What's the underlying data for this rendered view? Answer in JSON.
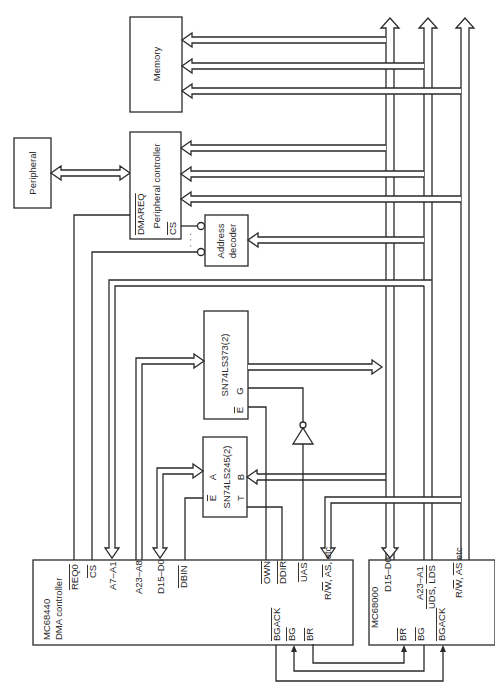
{
  "diagram": {
    "type": "block-diagram",
    "orientation": "rotated-90-ccw",
    "blocks": {
      "memory": "Memory",
      "peripheral": "Peripheral",
      "peripheral_controller": "Peripheral controller",
      "address_decoder_1": "Address",
      "address_decoder_2": "decoder",
      "latch": "SN74LS373(2)",
      "transceiver": "SN74LS245(2)",
      "dma_name": "MC68440",
      "dma_desc": "DMA controller",
      "cpu_name": "MC68000"
    },
    "pins": {
      "pc_dmareq": "DMAREQ",
      "pc_cs": "CS",
      "latch_g": "G",
      "latch_e": "E",
      "xcvr_a": "A",
      "xcvr_b": "B",
      "xcvr_e": "E",
      "xcvr_t": "T",
      "dma_reqo": "REQ0",
      "dma_cs": "CS",
      "dma_a7a1": "A7–A1",
      "dma_a23a8": "A23–A8",
      "dma_d15d0": "D15–D0",
      "dma_dbin": "DBIN",
      "dma_own": "OWN",
      "dma_ddir": "DDIR",
      "dma_uas": "UAS",
      "dma_rw_pre": "R/",
      "dma_rw_w": "W",
      "dma_rw_sep": ", ",
      "dma_rw_as": "AS",
      "dma_rw_etc": ", etc",
      "dma_bgack": "BGACK",
      "dma_bg": "BG",
      "dma_br": "BR",
      "cpu_d15d0": "D15–D0",
      "cpu_a23a1": "A23–A1",
      "cpu_uds": "UDS",
      "cpu_lds": "LDS",
      "cpu_rw_pre": "R/",
      "cpu_rw_w": "W",
      "cpu_rw_sep": ", ",
      "cpu_rw_as": "AS",
      "cpu_rw_etc": " etc",
      "cpu_br": "BR",
      "cpu_bg": "BG",
      "cpu_bgack": "BGACK"
    },
    "decoder_dots": "· · ·"
  }
}
